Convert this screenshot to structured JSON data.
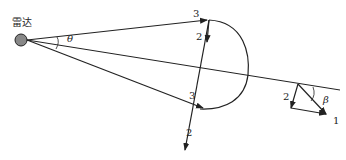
{
  "labels": {
    "radar": "雷达",
    "theta": "θ",
    "beta": "β",
    "ray_top": "3",
    "ray_bottom": "3",
    "down_upper": "2",
    "down_lower": "2",
    "vec_2": "2",
    "vec_1": "1"
  },
  "colors": {
    "line": "#222222",
    "radar_fill": "#888888"
  }
}
